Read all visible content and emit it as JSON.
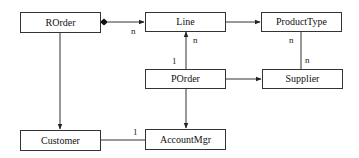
{
  "diagram": {
    "type": "uml-class-diagram",
    "classes": [
      {
        "id": "rorder",
        "name": "ROrder"
      },
      {
        "id": "line",
        "name": "Line"
      },
      {
        "id": "producttype",
        "name": "ProductType"
      },
      {
        "id": "porder",
        "name": "POrder"
      },
      {
        "id": "supplier",
        "name": "Supplier"
      },
      {
        "id": "customer",
        "name": "Customer"
      },
      {
        "id": "accountmgr",
        "name": "AccountMgr"
      }
    ],
    "associations": [
      {
        "from": "ROrder",
        "to": "Line",
        "kind": "composition",
        "to_multiplicity": "n"
      },
      {
        "from": "Line",
        "to": "ProductType",
        "kind": "directed"
      },
      {
        "from": "ProductType",
        "to": "Supplier",
        "kind": "association",
        "from_multiplicity": "n",
        "to_multiplicity": "n"
      },
      {
        "from": "POrder",
        "to": "Line",
        "kind": "directed",
        "from_multiplicity": "1",
        "to_multiplicity": "n"
      },
      {
        "from": "POrder",
        "to": "Supplier",
        "kind": "directed"
      },
      {
        "from": "ROrder",
        "to": "Customer",
        "kind": "directed"
      },
      {
        "from": "POrder",
        "to": "AccountMgr",
        "kind": "directed"
      },
      {
        "from": "Customer",
        "to": "AccountMgr",
        "kind": "association",
        "to_multiplicity": "1"
      }
    ],
    "labels": {
      "rorder_line_n": "n",
      "porder_line_n": "n",
      "porder_line_1": "1",
      "producttype_supplier_n_top": "n",
      "producttype_supplier_n_bottom": "n",
      "customer_accountmgr_1": "1"
    }
  }
}
